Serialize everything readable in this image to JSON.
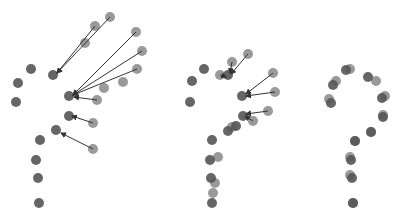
{
  "colors": {
    "background": "#ffffff",
    "target_dot": "#555555",
    "source_dot": "#888888",
    "arrow": "#333333"
  },
  "dot_radius": 5,
  "panels": [
    {
      "name": "panel-initial",
      "targets": [
        [
          18,
          83
        ],
        [
          31,
          69
        ],
        [
          16,
          102
        ],
        [
          53,
          75
        ],
        [
          69,
          96
        ],
        [
          69,
          116
        ],
        [
          56,
          130
        ],
        [
          40,
          140
        ],
        [
          36,
          160
        ],
        [
          38,
          178
        ],
        [
          39,
          203
        ]
      ],
      "sources": [
        [
          110,
          17
        ],
        [
          95,
          26
        ],
        [
          85,
          43
        ],
        [
          136,
          32
        ],
        [
          142,
          51
        ],
        [
          137,
          69
        ],
        [
          123,
          82
        ],
        [
          104,
          88
        ],
        [
          97,
          100
        ],
        [
          93,
          123
        ],
        [
          93,
          149
        ]
      ],
      "arrows": [
        [
          [
            110,
            17
          ],
          [
            57,
            73
          ]
        ],
        [
          [
            95,
            26
          ],
          [
            57,
            73
          ]
        ],
        [
          [
            136,
            32
          ],
          [
            73,
            95
          ]
        ],
        [
          [
            142,
            51
          ],
          [
            73,
            95
          ]
        ],
        [
          [
            137,
            69
          ],
          [
            73,
            95
          ]
        ],
        [
          [
            97,
            100
          ],
          [
            74,
            97
          ]
        ],
        [
          [
            93,
            123
          ],
          [
            72,
            116
          ]
        ],
        [
          [
            93,
            149
          ],
          [
            61,
            133
          ]
        ]
      ]
    },
    {
      "name": "panel-midway",
      "targets": [
        [
          192,
          81
        ],
        [
          204,
          69
        ],
        [
          190,
          102
        ],
        [
          228,
          75
        ],
        [
          242,
          96
        ],
        [
          243,
          116
        ],
        [
          236,
          126
        ],
        [
          228,
          131
        ],
        [
          212,
          140
        ],
        [
          210,
          160
        ],
        [
          211,
          178
        ],
        [
          212,
          203
        ]
      ],
      "sources": [
        [
          232,
          62
        ],
        [
          248,
          54
        ],
        [
          220,
          75
        ],
        [
          273,
          73
        ],
        [
          275,
          92
        ],
        [
          268,
          111
        ],
        [
          253,
          121
        ],
        [
          232,
          127
        ],
        [
          218,
          157
        ],
        [
          215,
          183
        ],
        [
          213,
          193
        ]
      ],
      "arrows": [
        [
          [
            232,
            62
          ],
          [
            230,
            73
          ]
        ],
        [
          [
            248,
            54
          ],
          [
            231,
            74
          ]
        ],
        [
          [
            220,
            75
          ],
          [
            226,
            77
          ]
        ],
        [
          [
            273,
            73
          ],
          [
            246,
            94
          ]
        ],
        [
          [
            275,
            92
          ],
          [
            246,
            96
          ]
        ],
        [
          [
            268,
            111
          ],
          [
            246,
            114
          ]
        ],
        [
          [
            253,
            121
          ],
          [
            245,
            116
          ]
        ]
      ]
    },
    {
      "name": "panel-final",
      "targets": [
        [
          346,
          70
        ],
        [
          333,
          85
        ],
        [
          331,
          103
        ],
        [
          368,
          77
        ],
        [
          382,
          98
        ],
        [
          383,
          117
        ],
        [
          371,
          132
        ],
        [
          355,
          141
        ],
        [
          351,
          160
        ],
        [
          352,
          178
        ],
        [
          353,
          203
        ]
      ],
      "sources": [
        [
          350,
          69
        ],
        [
          336,
          81
        ],
        [
          329,
          99
        ],
        [
          376,
          81
        ],
        [
          385,
          96
        ],
        [
          383,
          115
        ],
        [
          371,
          132
        ],
        [
          355,
          141
        ],
        [
          350,
          157
        ],
        [
          350,
          175
        ],
        [
          353,
          203
        ]
      ],
      "arrows": []
    }
  ]
}
